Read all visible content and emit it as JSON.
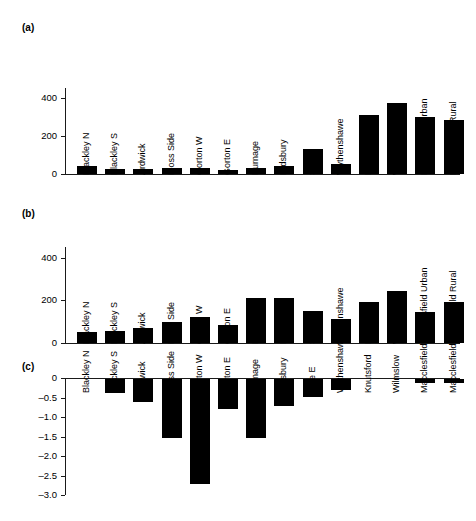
{
  "figure": {
    "panels": [
      {
        "id": "a",
        "label": "(a)",
        "yticks": [
          "0",
          "200",
          "400"
        ]
      },
      {
        "id": "b",
        "label": "(b)",
        "yticks": [
          "0",
          "200",
          "400"
        ]
      },
      {
        "id": "c",
        "label": "(c)",
        "yticks": [
          "0",
          "–0.5",
          "–1.0",
          "–1.5",
          "–2.0",
          "–2.5",
          "–3.0"
        ]
      }
    ]
  },
  "chart_data": [
    {
      "type": "bar",
      "panel": "a",
      "title": "(a)",
      "xlabel": "",
      "ylabel": "",
      "ylim": [
        0,
        450
      ],
      "grid": false,
      "legend": null,
      "categories": [
        "Blackley N",
        "Blackley S",
        "Ardwick",
        "Moss Side",
        "Gorton W",
        "Gorton E",
        "Burnage",
        "Didsbury",
        "Sale E",
        "Wythenshawe",
        "Knutsford",
        "Wilmslow",
        "Macclesfield Urban",
        "Macclesfield Rural"
      ],
      "values": [
        42,
        25,
        24,
        33,
        33,
        22,
        32,
        42,
        132,
        50,
        310,
        370,
        300,
        280
      ],
      "ytick_values": [
        0,
        200,
        400
      ],
      "ytick_labels": [
        "0",
        "200",
        "400"
      ]
    },
    {
      "type": "bar",
      "panel": "b",
      "title": "(b)",
      "xlabel": "",
      "ylabel": "",
      "ylim": [
        0,
        450
      ],
      "grid": false,
      "legend": null,
      "categories": [
        "Blackley N",
        "Blackley S",
        "Ardwick",
        "Moss Side",
        "Gorton W",
        "Gorton E",
        "Burnage",
        "Didsbury",
        "Sale E",
        "Wythenshawe",
        "Knutsford",
        "Wilmslow",
        "Macclesfield Urban",
        "Macclesfield Rural"
      ],
      "values": [
        50,
        57,
        70,
        97,
        123,
        83,
        213,
        212,
        150,
        112,
        190,
        242,
        143,
        190
      ],
      "ytick_values": [
        0,
        200,
        400
      ],
      "ytick_labels": [
        "0",
        "200",
        "400"
      ]
    },
    {
      "type": "bar",
      "panel": "c",
      "title": "(c)",
      "xlabel": "",
      "ylabel": "",
      "ylim": [
        -3.0,
        0
      ],
      "grid": false,
      "legend": null,
      "categories": [
        "Blackley N",
        "Blackley S",
        "Ardwick",
        "Moss Side",
        "Gorton W",
        "Gorton E",
        "Burnage",
        "Didsbury",
        "Sale E",
        "Wythenshawe",
        "Knutsford",
        "Wilmslow",
        "Macclesfield Urban",
        "Macclesfield Rural"
      ],
      "values": [
        0.0,
        -0.37,
        -0.58,
        -1.5,
        -2.7,
        -0.78,
        -1.5,
        -0.7,
        -0.45,
        -0.28,
        0.0,
        0.0,
        -0.1,
        -0.1
      ],
      "ytick_values": [
        0,
        -0.5,
        -1.0,
        -1.5,
        -2.0,
        -2.5,
        -3.0
      ],
      "ytick_labels": [
        "0",
        "–0.5",
        "–1.0",
        "–1.5",
        "–2.0",
        "–2.5",
        "–3.0"
      ]
    }
  ],
  "colors": {
    "bar": "#000000",
    "axis": "#1a1a1a",
    "background": "#ffffff",
    "text": "#000000"
  }
}
